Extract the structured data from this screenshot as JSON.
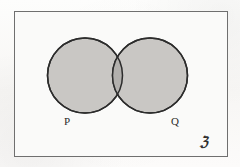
{
  "diagram": {
    "kind": "venn-diagram",
    "title_visible": false,
    "universe": {
      "label": "ℨ",
      "label_name": "universal-set-symbol",
      "shape": "rectangle",
      "border_color": "#6f6f6f",
      "fill_color": "#fafaf9"
    },
    "sets": [
      {
        "id": "P",
        "label": "P",
        "cx": 85,
        "cy": 75.5,
        "r": 37.5,
        "fill_color": "#c9c7c4",
        "stroke_color": "#2c2c2c",
        "shaded": true
      },
      {
        "id": "Q",
        "label": "Q",
        "cx": 150,
        "cy": 75.5,
        "r": 37.5,
        "fill_color": "#c9c7c4",
        "stroke_color": "#2c2c2c",
        "shaded": true
      }
    ],
    "intersection": {
      "label": "",
      "fill_color": "#b2b0ad",
      "shaded": true
    },
    "background_color": "#fbfbfa"
  }
}
